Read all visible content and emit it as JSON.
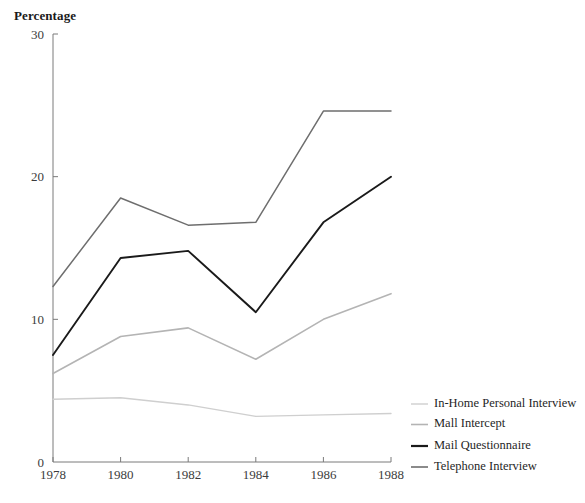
{
  "chart_data": {
    "type": "line",
    "title": "",
    "ylabel": "Percentage",
    "xlabel": "",
    "x": [
      1978,
      1980,
      1982,
      1984,
      1986,
      1988
    ],
    "xtick_labels": [
      "1978",
      "1980",
      "1982",
      "1984",
      "1986",
      "1988"
    ],
    "ytick_labels": [
      "0",
      "10",
      "20",
      "30"
    ],
    "yticks": [
      0,
      10,
      20,
      30
    ],
    "ylim": [
      0,
      30
    ],
    "xlim": [
      1978,
      1988
    ],
    "grid": false,
    "legend_position": "right",
    "series": [
      {
        "name": "In-Home Personal Interview",
        "values": [
          4.4,
          4.5,
          4.0,
          3.2,
          3.3,
          3.4
        ],
        "color": "#cfcfcf",
        "width": 1.4
      },
      {
        "name": "Mall Intercept",
        "values": [
          6.2,
          8.8,
          9.4,
          7.2,
          10.0,
          11.8
        ],
        "color": "#b4b4b4",
        "width": 1.6
      },
      {
        "name": "Mail Questionnaire",
        "values": [
          7.5,
          14.3,
          14.8,
          10.5,
          16.8,
          20.0
        ],
        "color": "#1a1a1a",
        "width": 1.9
      },
      {
        "name": "Telephone Interview",
        "values": [
          12.3,
          18.5,
          16.6,
          16.8,
          24.6,
          24.6
        ],
        "color": "#6e6e6e",
        "width": 1.5
      }
    ]
  },
  "legend": {
    "entries": [
      {
        "label": "In-Home Personal Interview",
        "color": "#cfcfcf",
        "width": 1.4
      },
      {
        "label": "Mall Intercept",
        "color": "#b4b4b4",
        "width": 1.6
      },
      {
        "label": "Mail Questionnaire",
        "color": "#1a1a1a",
        "width": 2.2
      },
      {
        "label": "Telephone Interview",
        "color": "#6e6e6e",
        "width": 1.6
      }
    ]
  },
  "axis": {
    "line_color": "#7a7a7a"
  }
}
